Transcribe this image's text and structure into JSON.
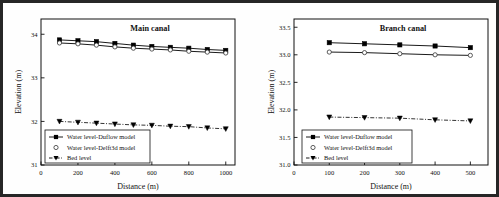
{
  "figure": {
    "panel_count": 2,
    "border_color": "#262626",
    "background": "#fefefe"
  },
  "chart_data": [
    {
      "type": "line",
      "title": "Main canal",
      "xlabel": "Distance (m)",
      "ylabel": "Elevation (m)",
      "xlim": [
        0,
        1050
      ],
      "ylim": [
        31,
        34.35
      ],
      "xticks": [
        0,
        200,
        400,
        600,
        800,
        1000
      ],
      "xtick_labels": [
        "0",
        "200",
        "400",
        "600",
        "800",
        "1000"
      ],
      "yticks": [
        31,
        32,
        33,
        34
      ],
      "ytick_labels": [
        "31",
        "32",
        "33",
        "34"
      ],
      "grid": false,
      "legend_position": "lower left",
      "x": [
        100,
        200,
        300,
        400,
        500,
        600,
        700,
        800,
        900,
        1000
      ],
      "series": [
        {
          "name": "Water level-Duflow model",
          "marker": "filled-square",
          "line": "solid",
          "color": "#000000",
          "values": [
            33.87,
            33.85,
            33.83,
            33.79,
            33.75,
            33.72,
            33.7,
            33.68,
            33.65,
            33.63
          ]
        },
        {
          "name": "Water level-Delft3d model",
          "marker": "open-circle",
          "line": "solid",
          "color": "#000000",
          "values": [
            33.8,
            33.78,
            33.75,
            33.71,
            33.68,
            33.66,
            33.64,
            33.61,
            33.59,
            33.57
          ]
        },
        {
          "name": "Bed level",
          "marker": "filled-triangle-down",
          "line": "dash-dot",
          "color": "#000000",
          "values": [
            32.0,
            31.98,
            31.96,
            31.94,
            31.92,
            31.91,
            31.89,
            31.88,
            31.85,
            31.83
          ]
        }
      ]
    },
    {
      "type": "line",
      "title": "Branch canal",
      "xlabel": "Distance (m)",
      "ylabel": "Elevation (m)",
      "xlim": [
        0,
        550
      ],
      "ylim": [
        31.0,
        33.65
      ],
      "xticks": [
        0,
        100,
        200,
        300,
        400,
        500
      ],
      "xtick_labels": [
        "0",
        "100",
        "200",
        "300",
        "400",
        "500"
      ],
      "yticks": [
        31.0,
        31.5,
        32.0,
        32.5,
        33.0,
        33.5
      ],
      "ytick_labels": [
        "31.0",
        "31.5",
        "32.0",
        "32.5",
        "33.0",
        "33.5"
      ],
      "grid": false,
      "legend_position": "lower left",
      "x": [
        100,
        200,
        300,
        400,
        500
      ],
      "series": [
        {
          "name": "Water level-Duflow model",
          "marker": "filled-square",
          "line": "solid",
          "color": "#000000",
          "values": [
            33.22,
            33.2,
            33.18,
            33.16,
            33.13
          ]
        },
        {
          "name": "Water level-Delft3d model",
          "marker": "open-circle",
          "line": "solid",
          "color": "#000000",
          "values": [
            33.05,
            33.04,
            33.02,
            33.0,
            32.99
          ]
        },
        {
          "name": "Bed level",
          "marker": "filled-triangle-down",
          "line": "dash-dot",
          "color": "#000000",
          "values": [
            31.87,
            31.86,
            31.85,
            31.82,
            31.8
          ]
        }
      ]
    }
  ]
}
